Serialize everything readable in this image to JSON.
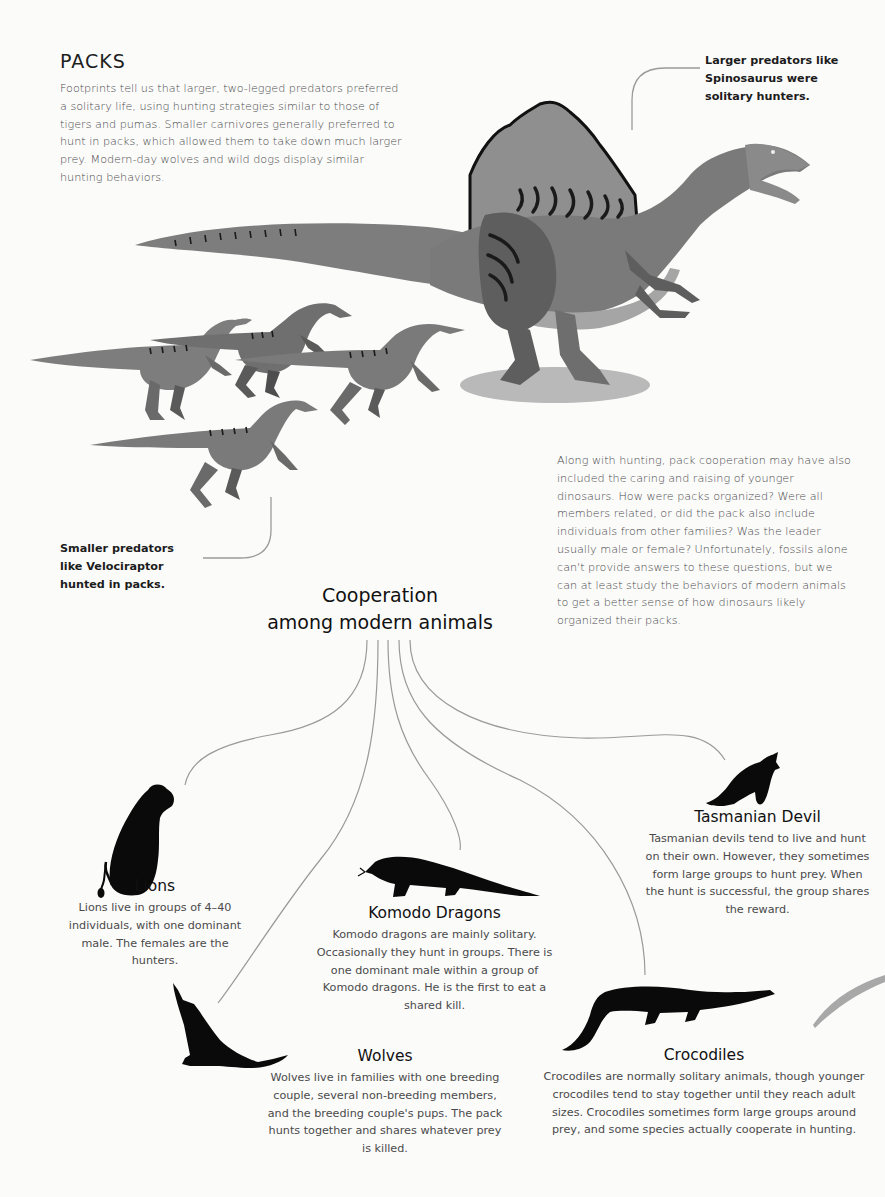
{
  "section": {
    "title": "PACKS",
    "intro": "Footprints tell us that larger, two-legged predators preferred a solitary life, using hunting strategies similar to those of tigers and pumas. Smaller carnivores generally preferred to hunt in packs, which allowed them to take down much larger prey. Modern-day wolves and wild dogs display similar hunting behaviors."
  },
  "callouts": {
    "spinosaurus": "Larger predators like Spinosaurus were solitary hunters.",
    "velociraptor": "Smaller predators like Velociraptor hunted in packs."
  },
  "pack_paragraph": "Along with hunting, pack cooperation may have also included the caring and raising of younger dinosaurs. How were packs organized? Were all members related, or did the pack also include individuals from other families? Was the leader usually male or female? Unfortunately, fossils alone can't provide answers to these questions, but we can at least study the behaviors of modern animals to get a better sense of how dinosaurs likely organized their packs.",
  "cooperation": {
    "heading_line1": "Cooperation",
    "heading_line2": "among modern animals",
    "animals": [
      {
        "name": "Lions",
        "icon": "lion-silhouette-icon",
        "description": "Lions live in groups of 4–40 individuals, with one dominant male. The females are the hunters."
      },
      {
        "name": "Komodo Dragons",
        "icon": "komodo-dragon-silhouette-icon",
        "description": "Komodo dragons are mainly solitary. Occasionally they hunt in groups. There is one dominant male within a group of Komodo dragons. He is the first to eat a shared kill."
      },
      {
        "name": "Tasmanian Devil",
        "icon": "tasmanian-devil-silhouette-icon",
        "description": "Tasmanian devils tend to live and hunt on their own. However, they sometimes form large groups to hunt prey. When the hunt is successful, the group shares the reward."
      },
      {
        "name": "Wolves",
        "icon": "wolf-silhouette-icon",
        "description": "Wolves live in families with one breeding couple, several non-breeding members, and the breeding couple's pups. The pack hunts together and shares whatever prey is killed."
      },
      {
        "name": "Crocodiles",
        "icon": "crocodile-silhouette-icon",
        "description": "Crocodiles are normally solitary animals, though younger crocodiles tend to stay together until they reach adult sizes. Crocodiles sometimes form large groups around prey, and some species actually cooperate in hunting."
      }
    ]
  },
  "colors": {
    "background": "#fbfbfa",
    "dino_light": "#8a8a8a",
    "dino_mid": "#6e6e6e",
    "dino_dark": "#4a4a4a",
    "stripe": "#1e1e1e",
    "silhouette": "#0a0a0a",
    "connector": "#9a9a9a"
  }
}
